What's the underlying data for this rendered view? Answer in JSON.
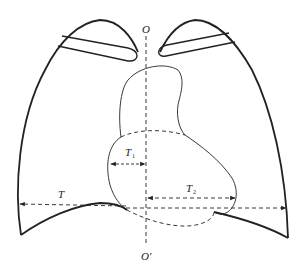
{
  "diagram": {
    "type": "chest-radiograph-cardiothoracic-ratio",
    "labels": {
      "top_axis": "O",
      "bottom_axis": "O'",
      "thoracic_width": "T",
      "right_heart_width": "T",
      "right_heart_sub": "1",
      "left_heart_width": "T",
      "left_heart_sub": "2"
    },
    "colors": {
      "stroke": "#222222",
      "background": "#ffffff"
    }
  }
}
